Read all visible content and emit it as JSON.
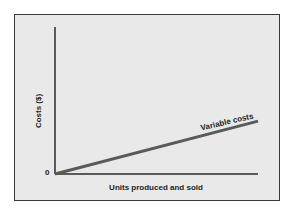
{
  "chart_data": {
    "type": "line",
    "title": "",
    "xlabel": "Units produced and sold",
    "ylabel": "Costs ($)",
    "origin_label": "0",
    "x": [
      0,
      1
    ],
    "series": [
      {
        "name": "Variable costs",
        "values": [
          0,
          0.36
        ]
      }
    ],
    "xlim": [
      0,
      1
    ],
    "ylim": [
      0,
      1
    ],
    "grid": false,
    "legend": "inline label on line",
    "colors": {
      "line": "#5a5a5a",
      "axes": "#2a2a2a",
      "background": "#e9e9e9",
      "frame": "#3a3a3a"
    }
  }
}
